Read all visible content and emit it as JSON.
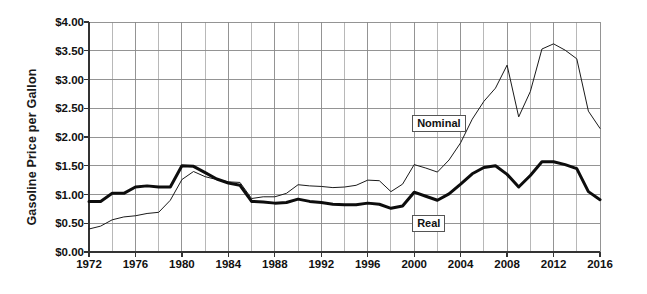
{
  "chart_data": {
    "type": "line",
    "title": "",
    "xlabel": "",
    "ylabel": "Gasoline Price per Gallon",
    "xlim": [
      1972,
      2016
    ],
    "ylim": [
      0.0,
      4.0
    ],
    "ytick_format": "$0.00",
    "yticks": [
      "$0.00",
      "$0.50",
      "$1.00",
      "$1.50",
      "$2.00",
      "$2.50",
      "$3.00",
      "$3.50",
      "$4.00"
    ],
    "ytick_values": [
      0.0,
      0.5,
      1.0,
      1.5,
      2.0,
      2.5,
      3.0,
      3.5,
      4.0
    ],
    "xticks": [
      "1972",
      "1976",
      "1980",
      "1984",
      "1988",
      "1992",
      "1996",
      "2000",
      "2004",
      "2008",
      "2012",
      "2016"
    ],
    "xtick_values": [
      1972,
      1976,
      1980,
      1984,
      1988,
      1992,
      1996,
      2000,
      2004,
      2008,
      2012,
      2016
    ],
    "grid": true,
    "grid_x_step": 2,
    "grid_y_step": 0.5,
    "legend_position": "inline-annotation",
    "x": [
      1972,
      1973,
      1974,
      1975,
      1976,
      1977,
      1978,
      1979,
      1980,
      1981,
      1982,
      1983,
      1984,
      1985,
      1986,
      1987,
      1988,
      1989,
      1990,
      1991,
      1992,
      1993,
      1994,
      1995,
      1996,
      1997,
      1998,
      1999,
      2000,
      2001,
      2002,
      2003,
      2004,
      2005,
      2006,
      2007,
      2008,
      2009,
      2010,
      2011,
      2012,
      2013,
      2014,
      2015,
      2016
    ],
    "series": [
      {
        "name": "Nominal",
        "color": "#1a1a1a",
        "line_width": 1,
        "label_x": 2000,
        "label_y": 2.25,
        "values": [
          0.4,
          0.45,
          0.56,
          0.61,
          0.63,
          0.67,
          0.69,
          0.9,
          1.26,
          1.4,
          1.31,
          1.26,
          1.22,
          1.21,
          0.93,
          0.96,
          0.96,
          1.02,
          1.17,
          1.15,
          1.14,
          1.12,
          1.13,
          1.16,
          1.25,
          1.24,
          1.05,
          1.18,
          1.52,
          1.46,
          1.39,
          1.6,
          1.9,
          2.31,
          2.62,
          2.85,
          3.25,
          2.35,
          2.79,
          3.53,
          3.62,
          3.51,
          3.36,
          2.45,
          2.15
        ]
      },
      {
        "name": "Real",
        "color": "#0d0d0d",
        "line_width": 3,
        "label_x": 2000,
        "label_y": 0.5,
        "values": [
          0.88,
          0.88,
          1.02,
          1.02,
          1.13,
          1.15,
          1.13,
          1.13,
          1.5,
          1.49,
          1.38,
          1.27,
          1.2,
          1.16,
          0.88,
          0.87,
          0.85,
          0.86,
          0.92,
          0.88,
          0.86,
          0.83,
          0.82,
          0.82,
          0.85,
          0.83,
          0.76,
          0.8,
          1.04,
          0.97,
          0.9,
          1.01,
          1.18,
          1.36,
          1.47,
          1.5,
          1.35,
          1.13,
          1.33,
          1.57,
          1.57,
          1.52,
          1.45,
          1.05,
          0.91
        ]
      }
    ],
    "annotations": [
      {
        "text": "Nominal",
        "x": 2000,
        "y": 2.25
      },
      {
        "text": "Real",
        "x": 2000,
        "y": 0.5
      }
    ]
  },
  "plot_geometry": {
    "left": 89,
    "right": 600,
    "top": 22,
    "bottom": 252
  },
  "colors": {
    "axis": "#333333",
    "grid": "#888888",
    "text": "#111111",
    "background": "#ffffff"
  }
}
